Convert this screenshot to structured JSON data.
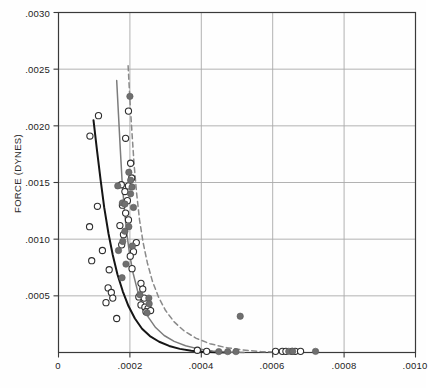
{
  "chart_data": {
    "type": "scatter",
    "title": "",
    "xlabel": "",
    "ylabel": "FORCE (DYNES)",
    "xlim": [
      0,
      0.001
    ],
    "ylim": [
      0,
      0.003
    ],
    "grid": true,
    "legend_position": "none",
    "xticks": [
      "0",
      ".0002",
      ".0004",
      ".0006",
      ".0008",
      ".0010"
    ],
    "xtick_values": [
      0,
      0.0002,
      0.0004,
      0.0006,
      0.0008,
      0.001
    ],
    "yticks": [
      ".0005",
      ".0010",
      ".0015",
      ".0020",
      ".0025",
      ".0030"
    ],
    "ytick_values": [
      0.0005,
      0.001,
      0.0015,
      0.002,
      0.0025,
      0.003
    ],
    "colors": {
      "curve_left": "#151515",
      "curve_middle": "#7c7c7c",
      "curve_right_dashed": "#8a8a8a",
      "open_marker_stroke": "#2e2e2e",
      "filled_marker": "#6f6f6f",
      "grid": "#a9a9a9",
      "axis": "#3a3a3a"
    },
    "series": [
      {
        "name": "curve-left-solid",
        "type": "line",
        "style": "solid",
        "color": "#151515",
        "points": [
          [
            9.8e-05,
            0.00205
          ],
          [
            0.000108,
            0.00178
          ],
          [
            0.000118,
            0.00152
          ],
          [
            0.000128,
            0.00128
          ],
          [
            0.00014,
            0.00105
          ],
          [
            0.000152,
            0.00086
          ],
          [
            0.000165,
            0.00069
          ],
          [
            0.00018,
            0.00054
          ],
          [
            0.000196,
            0.00041
          ],
          [
            0.000214,
            0.0003
          ],
          [
            0.000234,
            0.00021
          ],
          [
            0.000256,
            0.000145
          ],
          [
            0.000282,
            9.5e-05
          ],
          [
            0.00031,
            5.8e-05
          ],
          [
            0.00034,
            3.2e-05
          ],
          [
            0.000372,
            1.6e-05
          ],
          [
            0.000404,
            6e-06
          ],
          [
            0.00044,
            2e-06
          ],
          [
            0.00048,
            0.0
          ]
        ]
      },
      {
        "name": "curve-middle-solid",
        "type": "line",
        "style": "solid",
        "color": "#7c7c7c",
        "points": [
          [
            0.000163,
            0.0024
          ],
          [
            0.000168,
            0.0021
          ],
          [
            0.000173,
            0.0018
          ],
          [
            0.000178,
            0.00152
          ],
          [
            0.000184,
            0.00128
          ],
          [
            0.000191,
            0.00106
          ],
          [
            0.000199,
            0.00087
          ],
          [
            0.000209,
            0.0007
          ],
          [
            0.000221,
            0.00055
          ],
          [
            0.000235,
            0.00042
          ],
          [
            0.000252,
            0.00031
          ],
          [
            0.000272,
            0.00022
          ],
          [
            0.000296,
            0.00015
          ],
          [
            0.000324,
            9.8e-05
          ],
          [
            0.000356,
            6e-05
          ],
          [
            0.000392,
            3.2e-05
          ],
          [
            0.000432,
            1.4e-05
          ],
          [
            0.000476,
            5e-06
          ],
          [
            0.00052,
            1e-06
          ]
        ]
      },
      {
        "name": "curve-right-dashed",
        "type": "line",
        "style": "dashed",
        "color": "#8a8a8a",
        "points": [
          [
            0.000195,
            0.00253
          ],
          [
            0.0002,
            0.00223
          ],
          [
            0.000206,
            0.00193
          ],
          [
            0.000212,
            0.00165
          ],
          [
            0.000219,
            0.0014
          ],
          [
            0.000227,
            0.00117
          ],
          [
            0.000237,
            0.00097
          ],
          [
            0.000249,
            0.00079
          ],
          [
            0.000263,
            0.00063
          ],
          [
            0.00028,
            0.00049
          ],
          [
            0.0003,
            0.00037
          ],
          [
            0.000324,
            0.00027
          ],
          [
            0.000352,
            0.00019
          ],
          [
            0.000386,
            0.000125
          ],
          [
            0.000424,
            7.8e-05
          ],
          [
            0.000468,
            4.4e-05
          ],
          [
            0.000516,
            2.2e-05
          ],
          [
            0.000566,
            9e-06
          ],
          [
            0.00062,
            3e-06
          ],
          [
            0.00068,
            1e-06
          ]
        ]
      },
      {
        "name": "open-circles",
        "type": "scatter",
        "marker": "open-circle",
        "color": "#2e2e2e",
        "points": [
          [
            0.000112,
            0.00209
          ],
          [
            8.8e-05,
            0.00191
          ],
          [
            0.000196,
            0.00213
          ],
          [
            0.000188,
            0.00189
          ],
          [
            0.000202,
            0.00167
          ],
          [
            0.000205,
            0.00154
          ],
          [
            0.000196,
            0.00147
          ],
          [
            0.000176,
            0.00148
          ],
          [
            0.000186,
            0.00142
          ],
          [
            0.000193,
            0.00134
          ],
          [
            0.000179,
            0.0013
          ],
          [
            0.000188,
            0.00123
          ],
          [
            0.000196,
            0.00117
          ],
          [
            0.000109,
            0.00129
          ],
          [
            8.7e-05,
            0.00111
          ],
          [
            0.000172,
            0.00112
          ],
          [
            0.000182,
            0.00104
          ],
          [
            0.000218,
            0.00097
          ],
          [
            0.000177,
            0.00095
          ],
          [
            0.000123,
            0.0009
          ],
          [
            9.3e-05,
            0.00081
          ],
          [
            0.00021,
            0.00089
          ],
          [
            0.000201,
            0.00085
          ],
          [
            0.000142,
            0.00073
          ],
          [
            0.000206,
            0.00074
          ],
          [
            0.000139,
            0.00057
          ],
          [
            0.000148,
            0.00053
          ],
          [
            0.000231,
            0.00061
          ],
          [
            0.000236,
            0.00056
          ],
          [
            0.000225,
            0.00049
          ],
          [
            0.00024,
            0.00048
          ],
          [
            0.000133,
            0.00044
          ],
          [
            0.000152,
            0.00048
          ],
          [
            0.000231,
            0.00042
          ],
          [
            0.000242,
            0.0004
          ],
          [
            0.000251,
            0.00039
          ],
          [
            0.000245,
            0.00036
          ],
          [
            0.000258,
            0.00037
          ],
          [
            0.000163,
            0.0003
          ],
          [
            0.000389,
            2e-05
          ],
          [
            0.000415,
            1e-05
          ],
          [
            0.000608,
            1e-05
          ],
          [
            0.000627,
            1e-05
          ],
          [
            0.000637,
            1e-05
          ],
          [
            0.000654,
            1e-05
          ],
          [
            0.000663,
            1e-05
          ],
          [
            0.000678,
            1e-05
          ]
        ]
      },
      {
        "name": "filled-circles",
        "type": "scatter",
        "marker": "filled-circle",
        "color": "#6f6f6f",
        "points": [
          [
            0.0002,
            0.00226
          ],
          [
            0.000197,
            0.00159
          ],
          [
            0.000202,
            0.00152
          ],
          [
            0.000206,
            0.00146
          ],
          [
            0.000166,
            0.00147
          ],
          [
            0.000202,
            0.0014
          ],
          [
            0.000179,
            0.00132
          ],
          [
            0.000186,
            0.00131
          ],
          [
            0.00021,
            0.00128
          ],
          [
            0.000197,
            0.00111
          ],
          [
            0.000186,
            0.00107
          ],
          [
            0.00018,
            0.00098
          ],
          [
            0.000207,
            0.00094
          ],
          [
            0.000168,
            0.0009
          ],
          [
            0.000189,
            0.00078
          ],
          [
            0.000178,
            0.00066
          ],
          [
            0.000228,
            0.00051
          ],
          [
            0.000253,
            0.00048
          ],
          [
            0.000254,
            0.00043
          ],
          [
            0.000248,
            0.00035
          ],
          [
            0.000509,
            0.00032
          ],
          [
            0.000449,
            8e-06
          ],
          [
            0.000474,
            8e-06
          ],
          [
            0.000497,
            8e-06
          ],
          [
            0.000645,
            1e-05
          ],
          [
            0.000656,
            1e-05
          ],
          [
            0.00072,
            1e-05
          ]
        ]
      }
    ]
  }
}
